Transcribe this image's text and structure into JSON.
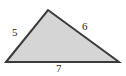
{
  "figure": {
    "kind": "geometry-figure",
    "shape": "triangle",
    "background_color": "#ffffff",
    "fill_color": "#d5d5d5",
    "stroke_color": "#3a3a3a",
    "label_color": "#1c1c1c",
    "stroke_width": 2,
    "vertices": {
      "left": {
        "x": 6,
        "y": 62
      },
      "apex": {
        "x": 48,
        "y": 10
      },
      "right": {
        "x": 119,
        "y": 62
      }
    },
    "polygon_points": "6,62 48,10 119,62",
    "sides": [
      {
        "name": "left-side",
        "label": "5",
        "from": "left",
        "to": "apex",
        "label_position": {
          "x": 12,
          "y": 27
        }
      },
      {
        "name": "right-side",
        "label": "6",
        "from": "apex",
        "to": "right",
        "label_position": {
          "x": 82,
          "y": 21
        }
      },
      {
        "name": "bottom-side",
        "label": "7",
        "from": "left",
        "to": "right",
        "label_position": {
          "x": 56,
          "y": 63
        }
      }
    ]
  }
}
